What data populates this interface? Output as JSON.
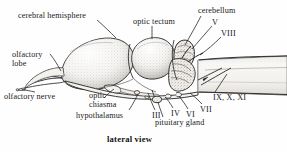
{
  "figure": {
    "title_caption": "lateral view",
    "background_color": "#fefefe",
    "ink_color": "#1a1a1a",
    "width": 287,
    "height": 152
  },
  "labels": [
    {
      "id": "cerebral-hemisphere",
      "text": "cerebral hemisphere",
      "x": 18,
      "y": 11,
      "align": "left"
    },
    {
      "id": "optic-tectum",
      "text": "optic tectum",
      "x": 133,
      "y": 17,
      "align": "left"
    },
    {
      "id": "cerebellum",
      "text": "cerebellum",
      "x": 198,
      "y": 7,
      "align": "left"
    },
    {
      "id": "olfactory-lobe-l1",
      "text": "olfactory",
      "x": 12,
      "y": 52,
      "align": "left"
    },
    {
      "id": "olfactory-lobe-l2",
      "text": "lobe",
      "x": 12,
      "y": 61,
      "align": "left"
    },
    {
      "id": "olfactory-nerve",
      "text": "olfactory nerve",
      "x": 5,
      "y": 94,
      "align": "left"
    },
    {
      "id": "optic-chiasma-l1",
      "text": "optic",
      "x": 89,
      "y": 92,
      "align": "left"
    },
    {
      "id": "optic-chiasma-l2",
      "text": "chiasma",
      "x": 89,
      "y": 101,
      "align": "left"
    },
    {
      "id": "hypothalamus",
      "text": "hypothalamus",
      "x": 77,
      "y": 112,
      "align": "left"
    },
    {
      "id": "pituitary-gland",
      "text": "pituitary gland",
      "x": 155,
      "y": 119,
      "align": "left"
    }
  ],
  "cranial_nerves": [
    {
      "id": "nerve-v",
      "text": "V",
      "x": 212,
      "y": 20
    },
    {
      "id": "nerve-viii",
      "text": "VIII",
      "x": 221,
      "y": 31
    },
    {
      "id": "nerve-ix-x-xi",
      "text": "IX, X, XI",
      "x": 213,
      "y": 95
    },
    {
      "id": "nerve-vii",
      "text": "VII",
      "x": 200,
      "y": 107
    },
    {
      "id": "nerve-vi",
      "text": "VI",
      "x": 186,
      "y": 112
    },
    {
      "id": "nerve-iv",
      "text": "IV",
      "x": 171,
      "y": 111
    },
    {
      "id": "nerve-iii",
      "text": "III",
      "x": 152,
      "y": 113
    }
  ],
  "anatomy_parts": [
    "cerebral hemisphere",
    "optic tectum",
    "cerebellum",
    "olfactory lobe",
    "olfactory nerve",
    "optic chiasma",
    "hypothalamus",
    "pituitary gland",
    "medulla / spinal cord"
  ]
}
